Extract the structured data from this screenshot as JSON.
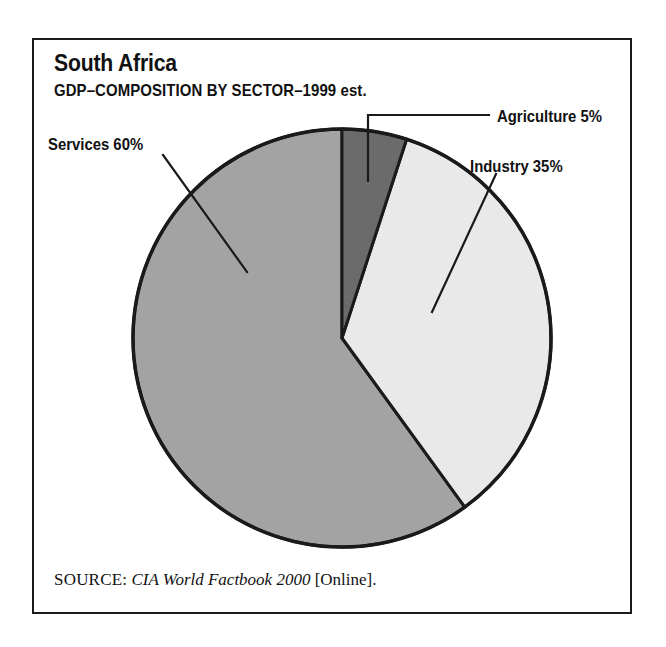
{
  "figure": {
    "title": "South Africa",
    "subtitle": "GDP–COMPOSITION BY SECTOR–1999 est."
  },
  "source": {
    "label": "SOURCE:",
    "title": "CIA World Factbook 2000",
    "suffix": "[Online]."
  },
  "labels": {
    "agriculture": "Agriculture 5%",
    "industry": "Industry 35%",
    "services": "Services 60%"
  },
  "colors": {
    "agriculture": "#6b6b6b",
    "industry": "#e9e9e9",
    "services": "#a3a3a3",
    "outline": "#1a1a1a",
    "background": "#ffffff",
    "text": "#111111"
  },
  "chart_data": {
    "type": "pie",
    "title": "South Africa",
    "subtitle": "GDP–COMPOSITION BY SECTOR–1999 est.",
    "xlabel": "",
    "ylabel": "",
    "categories": [
      "Agriculture",
      "Industry",
      "Services"
    ],
    "values": [
      5,
      35,
      60
    ],
    "units": "percent",
    "labels": [
      "Agriculture 5%",
      "Industry 35%",
      "Services 60%"
    ],
    "slice_colors": [
      "#6b6b6b",
      "#e9e9e9",
      "#a3a3a3"
    ],
    "start_angle_deg": 0,
    "direction": "clockwise",
    "legend": "none",
    "grid": false,
    "annotations": [
      "Agriculture 5%",
      "Industry 35%",
      "Services 60%"
    ],
    "source": "CIA World Factbook 2000 [Online]."
  }
}
